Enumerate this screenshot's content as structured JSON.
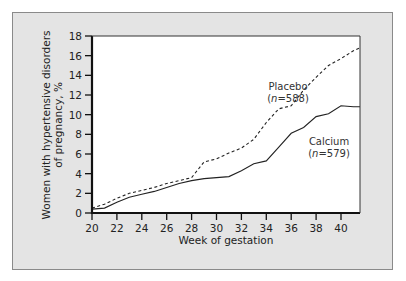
{
  "chart_data": {
    "type": "line",
    "title": "",
    "xlabel": "Week of gestation",
    "ylabel": "Women with hypertensive disorders of pregnancy, %",
    "ylabel_lines": [
      "Women with hypertensive disorders",
      "of pregnancy, %"
    ],
    "xlim": [
      20,
      41.5
    ],
    "ylim": [
      0,
      18
    ],
    "x_ticks": [
      20,
      22,
      24,
      26,
      28,
      30,
      32,
      34,
      36,
      38,
      40
    ],
    "y_ticks": [
      0,
      2,
      4,
      6,
      8,
      10,
      12,
      14,
      16,
      18
    ],
    "grid": false,
    "legend": "inline annotations",
    "x": [
      20,
      21,
      22,
      23,
      24,
      25,
      26,
      27,
      28,
      29,
      30,
      31,
      32,
      33,
      34,
      35,
      36,
      37,
      38,
      39,
      40,
      41
    ],
    "series": [
      {
        "name": "Placebo",
        "n_label": "(n=588)",
        "style": "dashed",
        "values": [
          0.5,
          0.9,
          1.5,
          2.0,
          2.3,
          2.6,
          3.0,
          3.3,
          3.6,
          5.2,
          5.5,
          6.1,
          6.6,
          7.5,
          9.2,
          10.6,
          10.9,
          12.5,
          13.8,
          15.0,
          15.7,
          16.5
        ]
      },
      {
        "name": "Calcium",
        "n_label": "(n=579)",
        "style": "solid",
        "values": [
          0.4,
          0.5,
          1.1,
          1.6,
          1.9,
          2.2,
          2.6,
          3.0,
          3.3,
          3.5,
          3.6,
          3.7,
          4.3,
          5.0,
          5.3,
          6.7,
          8.1,
          8.7,
          9.8,
          10.1,
          10.9,
          10.8
        ]
      }
    ]
  },
  "annotations": {
    "placebo_name": "Placebo",
    "placebo_n_prefix": "(",
    "placebo_n_italic": "n",
    "placebo_n_suffix": "=588)",
    "calcium_name": "Calcium",
    "calcium_n_prefix": "(",
    "calcium_n_italic": "n",
    "calcium_n_suffix": "=579)"
  },
  "colors": {
    "frame_bg": "#e4e4e4",
    "plot_bg": "#ffffff",
    "line": "#222222",
    "axis": "#111111"
  }
}
